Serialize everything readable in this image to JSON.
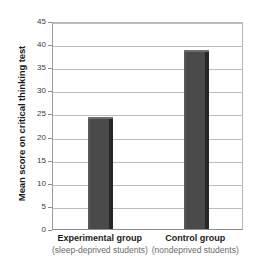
{
  "chart_data": {
    "type": "bar",
    "title": "",
    "xlabel": "",
    "ylabel": "Mean score on critical thinking test",
    "categories": [
      "Experimental group",
      "Control group"
    ],
    "category_sublabels": [
      "(sleep-deprived students)",
      "(nondeprived students)"
    ],
    "values": [
      24.2,
      38.7
    ],
    "ylim": [
      0,
      45
    ],
    "yticks": [
      0,
      5,
      10,
      15,
      20,
      25,
      30,
      35,
      40,
      45
    ],
    "ytick_labels": [
      "0",
      "5",
      "10",
      "15",
      "20",
      "25",
      "30",
      "35",
      "40",
      "45"
    ],
    "grid": true,
    "legend": "none",
    "bar_color": "#4a4a4a",
    "bar_side_color": "#272727",
    "gridline_color": "#bdbdbd",
    "axis_color": "#8c8c8c",
    "background_color": "#ffffff",
    "label_color": "#1a1a1a",
    "sublabel_color": "#6b6b6b"
  }
}
